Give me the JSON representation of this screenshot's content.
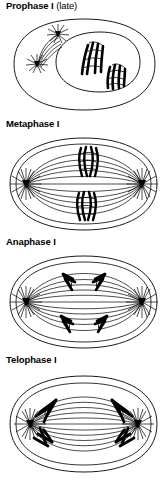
{
  "figure": {
    "background_color": "#ffffff",
    "ink_color": "#000000"
  },
  "panels": [
    {
      "id": "prophase-1-late",
      "label_bold": "Prophase I",
      "label_regular": "(late)",
      "description": "Late prophase I: intact cell membrane and nuclear envelope; two centrioles with radiating asters outside the nucleus; two tetrads (paired homologous chromosomes) inside the nucleus.",
      "features": {
        "cell_membrane": "rounded-rectangle outline",
        "nuclear_envelope": "inner oval outline",
        "centrioles": 2,
        "asters": 2,
        "chromosomes": 2,
        "chromosome_form": "tetrad",
        "spindle_fibers": "forming, short arcs between centrioles"
      }
    },
    {
      "id": "metaphase-1",
      "label_bold": "Metaphase I",
      "label_regular": "",
      "description": "Metaphase I: nuclear envelope gone; two tetrads aligned on the metaphase plate at the cell equator; full spindle stretches between two polar asters.",
      "features": {
        "cell_membrane": "wide oval outline",
        "nuclear_envelope": "absent",
        "centrioles": 2,
        "asters": 2,
        "chromosomes": 2,
        "chromosome_form": "tetrad at equator",
        "spindle_fibers": "full spindle, pole to pole"
      }
    },
    {
      "id": "anaphase-1",
      "label_bold": "Anaphase I",
      "label_regular": "",
      "description": "Anaphase I: homologous chromosomes separate and move as V shapes toward opposite poles along the spindle fibers.",
      "features": {
        "cell_membrane": "wide oval outline",
        "nuclear_envelope": "absent",
        "centrioles": 2,
        "asters": 2,
        "chromosomes": 4,
        "chromosome_form": "V-shaped, migrating",
        "spindle_fibers": "shortening toward poles"
      }
    },
    {
      "id": "telophase-1",
      "label_bold": "Telophase I",
      "label_regular": "",
      "description": "Telophase I: chromosomes have arrived at the two poles and cluster around the centrioles; spindle fibers span the cell between the poles.",
      "features": {
        "cell_membrane": "wide oval outline",
        "nuclear_envelope": "reforming",
        "centrioles": 2,
        "asters": 2,
        "chromosomes": 4,
        "chromosome_form": "clustered at poles",
        "spindle_fibers": "spanning cell"
      }
    }
  ]
}
